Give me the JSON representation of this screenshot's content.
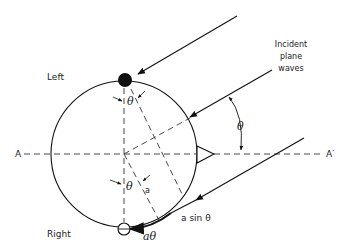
{
  "diagram": {
    "type": "geometry",
    "labels": {
      "left": "Left",
      "right": "Right",
      "incident_line1": "Incident",
      "incident_line2": "plane",
      "incident_line3": "waves",
      "axis_left": "A",
      "axis_right": "A′",
      "theta_top": "θ",
      "theta_right": "θ",
      "theta_center": "θ",
      "radius": "a",
      "path_sin": "a sin θ",
      "path_arc": "aθ"
    },
    "elements": [
      {
        "id": "head-circle",
        "center": [
          124,
          154
        ],
        "radius": 73
      },
      {
        "id": "left-ear",
        "type": "filled-dot",
        "position": [
          125,
          80
        ]
      },
      {
        "id": "right-ear",
        "type": "open-dot",
        "position": [
          124,
          229
        ]
      },
      {
        "id": "nose",
        "type": "triangle",
        "position": [
          197,
          154
        ]
      },
      {
        "id": "axis-AA",
        "type": "dashed-line",
        "from": [
          22,
          154
        ],
        "to": [
          325,
          154
        ]
      }
    ]
  }
}
